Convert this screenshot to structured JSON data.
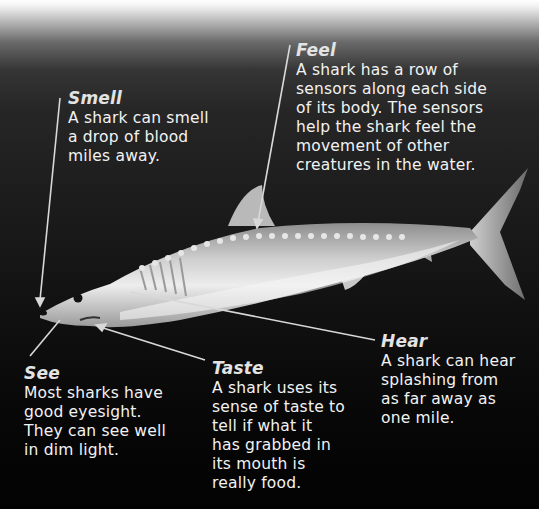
{
  "figure": {
    "colors": {
      "background_top": "#ffffff",
      "background_bottom": "#030303",
      "text": "#f2f2f2",
      "leader_line": "#d8d8d8"
    }
  },
  "labels": {
    "smell": {
      "title": "Smell",
      "lines": [
        "A shark can smell",
        "a drop of blood",
        "miles away."
      ]
    },
    "feel": {
      "title": "Feel",
      "lines": [
        "A shark has a row of",
        "sensors along each side",
        "of its body. The sensors",
        "help the shark feel the",
        "movement of other",
        "creatures in the water."
      ]
    },
    "see": {
      "title": "See",
      "lines": [
        "Most sharks have",
        "good eyesight.",
        "They can see well",
        "in dim light."
      ]
    },
    "taste": {
      "title": "Taste",
      "lines": [
        "A shark uses its",
        "sense of taste to",
        "tell if what it",
        "has grabbed in",
        "its mouth is",
        "really food."
      ]
    },
    "hear": {
      "title": "Hear",
      "lines": [
        "A shark can hear",
        "splashing from",
        "as far away as",
        "one mile."
      ]
    }
  }
}
